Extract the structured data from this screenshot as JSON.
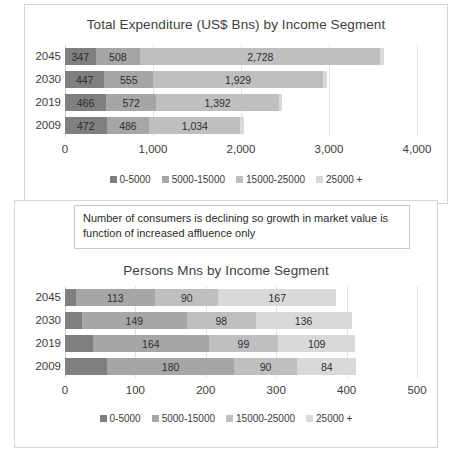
{
  "chart_data": [
    {
      "type": "bar",
      "id": "expenditure",
      "orientation": "horizontal",
      "stacked": true,
      "title": "Total Expenditure (US$ Bns) by Income Segment",
      "xlabel": "",
      "ylabel": "",
      "xlim": [
        0,
        4000
      ],
      "xticks": [
        "0",
        "1,000",
        "2,000",
        "3,000",
        "4,000"
      ],
      "xtick_values": [
        0,
        1000,
        2000,
        3000,
        4000
      ],
      "grid": true,
      "legend_position": "bottom",
      "categories": [
        "2045",
        "2030",
        "2019",
        "2009"
      ],
      "series": [
        {
          "name": "0-5000",
          "color": "#7f7f7f",
          "values": [
            347,
            447,
            466,
            472
          ],
          "labels": [
            "347",
            "447",
            "466",
            "472"
          ]
        },
        {
          "name": "5000-15000",
          "color": "#a6a6a6",
          "values": [
            508,
            555,
            572,
            486
          ],
          "labels": [
            "508",
            "555",
            "572",
            "486"
          ]
        },
        {
          "name": "15000-25000",
          "color": "#bfbfbf",
          "values": [
            2728,
            1929,
            1392,
            1034
          ],
          "labels": [
            "2,728",
            "1,929",
            "1,392",
            "1,034"
          ]
        },
        {
          "name": "25000 +",
          "color": "#d9d9d9",
          "values": [
            37,
            49,
            40,
            38
          ],
          "labels": [
            "",
            "",
            "",
            ""
          ]
        }
      ],
      "totals": [
        3620,
        2980,
        2470,
        2030
      ]
    },
    {
      "type": "bar",
      "id": "persons",
      "orientation": "horizontal",
      "stacked": true,
      "title": "Persons Mns by Income Segment",
      "xlabel": "",
      "ylabel": "",
      "xlim": [
        0,
        500
      ],
      "xticks": [
        "0",
        "100",
        "200",
        "300",
        "400",
        "500"
      ],
      "xtick_values": [
        0,
        100,
        200,
        300,
        400,
        500
      ],
      "grid": true,
      "legend_position": "bottom",
      "categories": [
        "2045",
        "2030",
        "2019",
        "2009"
      ],
      "series": [
        {
          "name": "0-5000",
          "color": "#7f7f7f",
          "values": [
            15,
            24,
            40,
            60
          ],
          "labels": [
            "",
            "",
            "",
            ""
          ]
        },
        {
          "name": "5000-15000",
          "color": "#a6a6a6",
          "values": [
            113,
            149,
            164,
            180
          ],
          "labels": [
            "113",
            "149",
            "164",
            "180"
          ]
        },
        {
          "name": "15000-25000",
          "color": "#bfbfbf",
          "values": [
            90,
            98,
            99,
            90
          ],
          "labels": [
            "90",
            "98",
            "99",
            "90"
          ]
        },
        {
          "name": "25000 +",
          "color": "#d9d9d9",
          "values": [
            167,
            136,
            109,
            84
          ],
          "labels": [
            "167",
            "136",
            "109",
            "84"
          ]
        }
      ],
      "totals": [
        385,
        407,
        412,
        414
      ]
    }
  ],
  "callout": {
    "text": "Number of consumers is declining so growth in market value is function of  increased affluence only"
  },
  "legend_labels": [
    "0-5000",
    "5000-15000",
    "15000-25000",
    "25000 +"
  ],
  "colors": {
    "seg1": "#7f7f7f",
    "seg2": "#a6a6a6",
    "seg3": "#bfbfbf",
    "seg4": "#d9d9d9",
    "gridline": "#e2e2e2",
    "panel_border": "#d6d6d6",
    "text": "#3b3b3b"
  }
}
